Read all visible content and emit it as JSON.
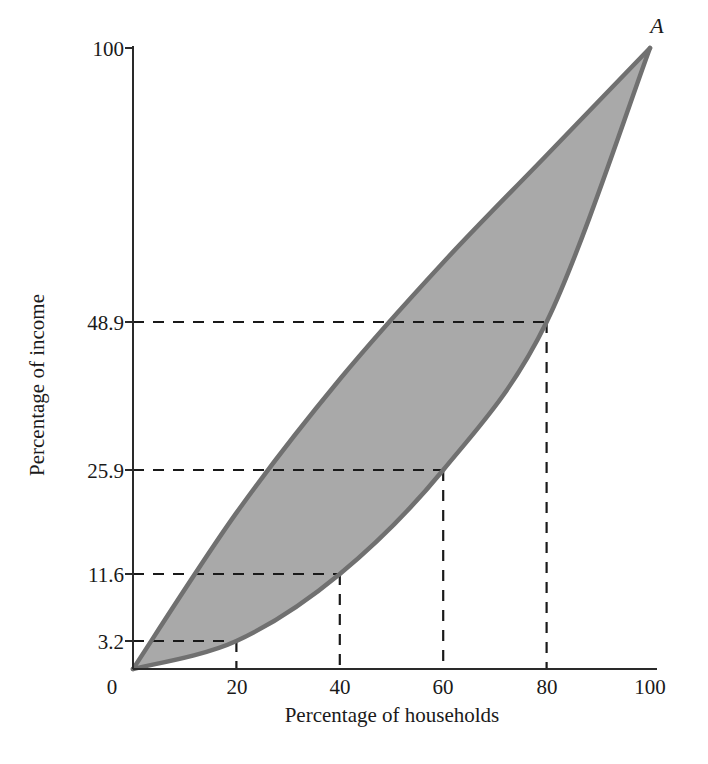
{
  "chart_data": {
    "type": "area",
    "title": "",
    "xlabel": "Percentage of households",
    "ylabel": "Percentage of income",
    "xlim": [
      0,
      100
    ],
    "ylim": [
      0,
      100
    ],
    "grid": false,
    "legend": null,
    "x_ticks": [
      "0",
      "20",
      "40",
      "60",
      "80",
      "100"
    ],
    "x_tick_values": [
      0,
      20,
      40,
      60,
      80,
      100
    ],
    "y_ticks": [
      "3.2",
      "11.6",
      "25.9",
      "48.9",
      "100"
    ],
    "y_tick_values": [
      3.2,
      11.6,
      25.9,
      48.9,
      100
    ],
    "annotations": [
      {
        "text": "A",
        "x": 100,
        "y": 100,
        "style": "italic"
      }
    ],
    "series": [
      {
        "name": "Line of equality",
        "type": "line",
        "x": [
          0,
          20,
          40,
          60,
          80,
          100
        ],
        "values": [
          0,
          20,
          40,
          60,
          80,
          100
        ]
      },
      {
        "name": "Lorenz curve",
        "type": "line",
        "x": [
          0,
          20,
          40,
          60,
          80,
          100
        ],
        "values": [
          0,
          3.2,
          11.6,
          25.9,
          48.9,
          100
        ]
      }
    ],
    "shaded_region": {
      "name": "Area of inequality",
      "between": [
        "Line of equality",
        "Lorenz curve"
      ],
      "fill": "#a9a9a9"
    },
    "guide_lines": [
      {
        "x": 20,
        "y": 3.2
      },
      {
        "x": 40,
        "y": 11.6
      },
      {
        "x": 60,
        "y": 25.9
      },
      {
        "x": 80,
        "y": 48.9
      }
    ],
    "colors": {
      "curve_stroke": "#707070",
      "shade_fill": "#a9a9a9",
      "axis": "#2a2a2a",
      "dash": "#1a1a1a",
      "background": "#ffffff"
    }
  },
  "labels": {
    "x_axis_title": "Percentage of households",
    "y_axis_title": "Percentage of income",
    "point_a": "A",
    "x0": "0",
    "x20": "20",
    "x40": "40",
    "x60": "60",
    "x80": "80",
    "x100": "100",
    "y3": "3.2",
    "y11": "11.6",
    "y25": "25.9",
    "y48": "48.9",
    "y100": "100"
  }
}
